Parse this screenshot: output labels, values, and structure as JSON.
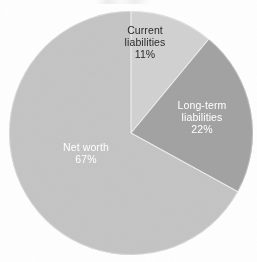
{
  "chart_data": {
    "type": "pie",
    "title": "",
    "subtitle": "",
    "xlabel": "",
    "ylabel": "",
    "legend_position": "none",
    "grid": false,
    "labels_inside_slices": true,
    "start_angle_deg": 0,
    "direction": "clockwise",
    "categories": [
      "Current liabilities",
      "Long-term liabilities",
      "Net worth"
    ],
    "values": [
      11,
      22,
      67
    ],
    "value_unit": "%",
    "slices": [
      {
        "name": "Current liabilities",
        "label_line1": "Current",
        "label_line2": "liabilities",
        "value": 11,
        "value_text": "11%",
        "color": "#d2d2d2",
        "text_color": "#2b2b2b",
        "start_angle_deg": 0,
        "end_angle_deg": 39.6
      },
      {
        "name": "Long-term liabilities",
        "label_line1": "Long-term",
        "label_line2": "liabilities",
        "value": 22,
        "value_text": "22%",
        "color": "#a3a3a3",
        "text_color": "#ffffff",
        "start_angle_deg": 39.6,
        "end_angle_deg": 118.8
      },
      {
        "name": "Net worth",
        "label_line1": "Net worth",
        "label_line2": "",
        "value": 67,
        "value_text": "67%",
        "color": "#c5c5c5",
        "text_color": "#ffffff",
        "start_angle_deg": 118.8,
        "end_angle_deg": 360
      }
    ],
    "separator_color": "#f2f2f2",
    "background_color": "#ffffff"
  },
  "geometry": {
    "center_x": 131,
    "center_y": 133,
    "radius": 122
  }
}
